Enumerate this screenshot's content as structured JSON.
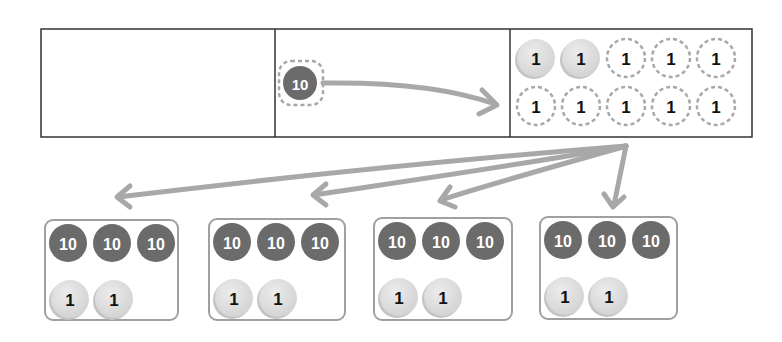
{
  "colors": {
    "ten_fill": "#6b6b6b",
    "ten_text": "#ffffff",
    "one_fill": "#dcdcdc",
    "one_text": "#111111",
    "dashed": "#a8a8a8",
    "arrow": "#a8a8a8",
    "table_border": "#333333",
    "group_border": "#a0a0a0"
  },
  "place_value_chart": {
    "cells": [
      {
        "name": "hundreds-cell",
        "coins": []
      },
      {
        "name": "tens-cell",
        "coins": [
          {
            "value": "10",
            "state": "moved-out"
          }
        ]
      },
      {
        "name": "ones-cell",
        "coins": [
          {
            "value": "1",
            "state": "original"
          },
          {
            "value": "1",
            "state": "original"
          },
          {
            "value": "1",
            "state": "traded-in"
          },
          {
            "value": "1",
            "state": "traded-in"
          },
          {
            "value": "1",
            "state": "traded-in"
          },
          {
            "value": "1",
            "state": "traded-in"
          },
          {
            "value": "1",
            "state": "traded-in"
          },
          {
            "value": "1",
            "state": "traded-in"
          },
          {
            "value": "1",
            "state": "traded-in"
          },
          {
            "value": "1",
            "state": "traded-in"
          }
        ]
      }
    ]
  },
  "groups": [
    {
      "tens": [
        "10",
        "10",
        "10"
      ],
      "ones": [
        "1",
        "1"
      ]
    },
    {
      "tens": [
        "10",
        "10",
        "10"
      ],
      "ones": [
        "1",
        "1"
      ]
    },
    {
      "tens": [
        "10",
        "10",
        "10"
      ],
      "ones": [
        "1",
        "1"
      ]
    },
    {
      "tens": [
        "10",
        "10",
        "10"
      ],
      "ones": [
        "1",
        "1"
      ]
    }
  ]
}
